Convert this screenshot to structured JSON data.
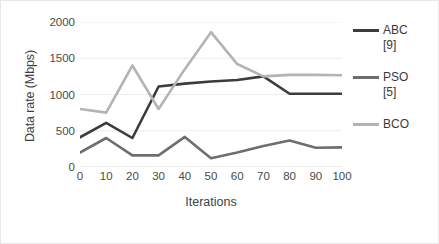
{
  "chart_data": {
    "type": "line",
    "title": "",
    "xlabel": "Iterations",
    "ylabel": "Data rate (Mbps)",
    "x": [
      0,
      10,
      20,
      30,
      40,
      50,
      60,
      70,
      80,
      90,
      100
    ],
    "xticklabels": [
      "0",
      "10",
      "20",
      "30",
      "40",
      "50",
      "60",
      "70",
      "80",
      "90",
      "100"
    ],
    "yticklabels": [
      "0",
      "500",
      "1000",
      "1500",
      "2000"
    ],
    "yticks": [
      0,
      500,
      1000,
      1500,
      2000
    ],
    "xlim": [
      0,
      100
    ],
    "ylim": [
      0,
      2000
    ],
    "grid": "horizontal",
    "legend_position": "right",
    "series": [
      {
        "name": "ABC [9]",
        "label_lines": [
          "ABC",
          "[9]"
        ],
        "color": "#3c3c3c",
        "values": [
          410,
          610,
          400,
          1110,
          1150,
          1180,
          1200,
          1250,
          1010,
          1010,
          1010
        ]
      },
      {
        "name": "PSO [5]",
        "label_lines": [
          "PSO",
          "[5]"
        ],
        "color": "#6e6e6e",
        "values": [
          200,
          400,
          160,
          160,
          415,
          120,
          200,
          290,
          365,
          265,
          270
        ]
      },
      {
        "name": "BCO",
        "label_lines": [
          "BCO"
        ],
        "color": "#b4b4b4",
        "values": [
          800,
          750,
          1400,
          800,
          1350,
          1860,
          1420,
          1250,
          1270,
          1270,
          1265
        ]
      }
    ]
  },
  "axis": {
    "ylabel": "Data rate (Mbps)",
    "xlabel": "Iterations"
  },
  "legend": {
    "items": [
      {
        "line1": "ABC",
        "line2": "[9]",
        "color": "#3c3c3c"
      },
      {
        "line1": "PSO",
        "line2": "[5]",
        "color": "#6e6e6e"
      },
      {
        "line1": "BCO",
        "line2": "",
        "color": "#b4b4b4"
      }
    ]
  },
  "colors": {
    "gridline": "#ececec",
    "axis": "#d9d9d9",
    "text": "#4a4a4a",
    "background": "#ffffff"
  }
}
